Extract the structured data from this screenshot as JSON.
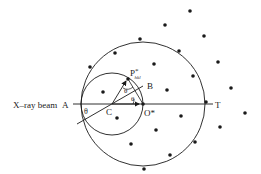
{
  "diagram": {
    "labels": {
      "beam": "X–ray beam",
      "A": "A",
      "B": "B",
      "C": "C",
      "O": "O*",
      "T": "T",
      "P": "P",
      "P_sup": "*",
      "P_sub": "hkl",
      "theta1": "θ",
      "theta2": "θ",
      "theta3": "θ"
    },
    "colors": {
      "ink": "#1a1a1a",
      "background": "#ffffff"
    },
    "large_circle": {
      "cx": 143,
      "cy": 104,
      "r": 62
    },
    "small_circle": {
      "cx": 112,
      "cy": 104,
      "r": 31
    },
    "reciprocal_lattice_points": [
      [
        190,
        11
      ],
      [
        165,
        25
      ],
      [
        204,
        36
      ],
      [
        140,
        39
      ],
      [
        179,
        51
      ],
      [
        115,
        53
      ],
      [
        218,
        62
      ],
      [
        154,
        64
      ],
      [
        90,
        67
      ],
      [
        193,
        76
      ],
      [
        128,
        79
      ],
      [
        231,
        88
      ],
      [
        103,
        92
      ],
      [
        167,
        90
      ],
      [
        206,
        102
      ],
      [
        143,
        104
      ],
      [
        245,
        113
      ],
      [
        181,
        116
      ],
      [
        117,
        118
      ],
      [
        220,
        127
      ],
      [
        156,
        130
      ],
      [
        195,
        142
      ],
      [
        131,
        144
      ],
      [
        170,
        155
      ],
      [
        144,
        169
      ]
    ]
  }
}
